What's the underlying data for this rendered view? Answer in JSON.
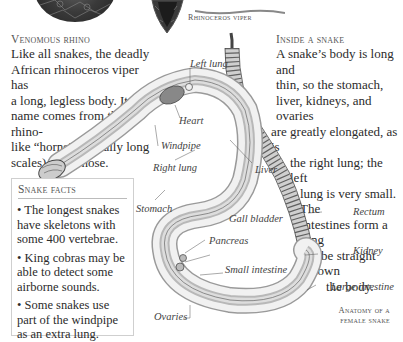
{
  "top_images": {
    "viper_caption": "Rhinoceros viper"
  },
  "venomous_rhino": {
    "heading": "Venomous rhino",
    "lines": [
      "Like all snakes, the deadly",
      "African rhinoceros viper has",
      "a long, legless body. Its",
      "name comes from the rhino-",
      "like “horns” (actually long",
      "scales) on its nose."
    ]
  },
  "inside_a_snake": {
    "heading": "Inside a snake",
    "lines": [
      "A snake’s body is long and",
      "thin, so the stomach,",
      "liver, kidneys, and ovaries",
      "are greatly elongated, as is",
      "the right lung; the left",
      "lung is very small. The",
      "intestines form a long",
      "tube straight down",
      "the body."
    ]
  },
  "snake_facts": {
    "title": "Snake facts",
    "facts": [
      "• The longest snakes have skeletons with some 400 vertebrae.",
      "• King cobras may be able to detect some airborne sounds.",
      "• Some snakes use part of the windpipe as an extra lung."
    ]
  },
  "diagram": {
    "labels": {
      "left_lung": "Left lung",
      "heart": "Heart",
      "windpipe": "Windpipe",
      "right_lung": "Right lung",
      "liver": "Liver",
      "stomach": "Stomach",
      "gall_bladder": "Gall bladder",
      "pancreas": "Pancreas",
      "small_intestine": "Small intestine",
      "ovaries": "Ovaries",
      "rectum": "Rectum",
      "kidney": "Kidney",
      "large_intestine": "Large intestine"
    },
    "caption_line1": "Anatomy of a",
    "caption_line2": "female snake"
  }
}
